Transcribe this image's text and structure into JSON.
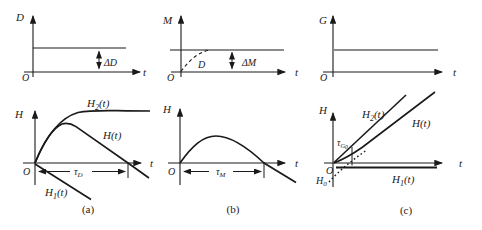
{
  "colors": {
    "ink": "#1a1a1a",
    "background": "#ffffff"
  },
  "panels": {
    "a_top": {
      "y_axis": "D",
      "x_axis": "t",
      "origin": "O",
      "delta": "ΔD"
    },
    "b_top": {
      "y_axis": "M",
      "x_axis": "t",
      "origin": "O",
      "delta": "ΔM",
      "dashed_label": "D"
    },
    "c_top": {
      "y_axis": "G",
      "x_axis": "t",
      "origin": "O"
    },
    "a_bottom": {
      "y_axis": "H",
      "x_axis": "t",
      "origin": "O",
      "caption": "(a)",
      "h2": {
        "base": "H",
        "sub": "2",
        "rest": "(t)"
      },
      "h": {
        "base": "H",
        "rest": "(t)"
      },
      "h1": {
        "base": "H",
        "sub": "1",
        "rest": "(t)"
      },
      "tau": {
        "base": "τ",
        "sub": "D"
      }
    },
    "b_bottom": {
      "y_axis": "H",
      "x_axis": "t",
      "origin": "O",
      "caption": "(b)",
      "tau": {
        "base": "τ",
        "sub": "M"
      }
    },
    "c_bottom": {
      "y_axis": "H",
      "x_axis": "t",
      "origin": "O",
      "caption": "(c)",
      "h2": {
        "base": "H",
        "sub": "2",
        "rest": "(t)"
      },
      "h": {
        "base": "H",
        "rest": "(t)"
      },
      "h1": {
        "base": "H",
        "sub": "1",
        "rest": "(t)"
      },
      "h0": {
        "base": "H",
        "sub": "0"
      },
      "tau": {
        "base": "τ",
        "sub": "G",
        "subsub": "0"
      }
    }
  }
}
